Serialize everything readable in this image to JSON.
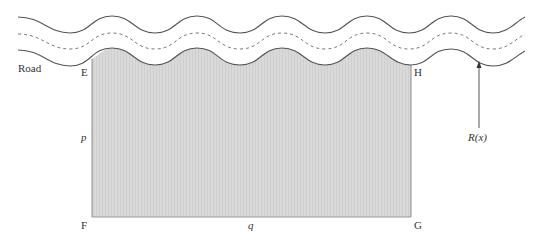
{
  "diagram": {
    "road_label": "Road",
    "corners": {
      "top_left": "E",
      "top_right": "H",
      "bottom_left": "F",
      "bottom_right": "G"
    },
    "side_labels": {
      "height": "p",
      "width": "q"
    },
    "function_label": "R(x)",
    "colors": {
      "road_line": "#555555",
      "center_line": "#7a7a7a",
      "plot_fill": "#d9d9d9",
      "plot_edge": "#8a8a8a",
      "arrow": "#555555",
      "text": "#333333"
    }
  }
}
